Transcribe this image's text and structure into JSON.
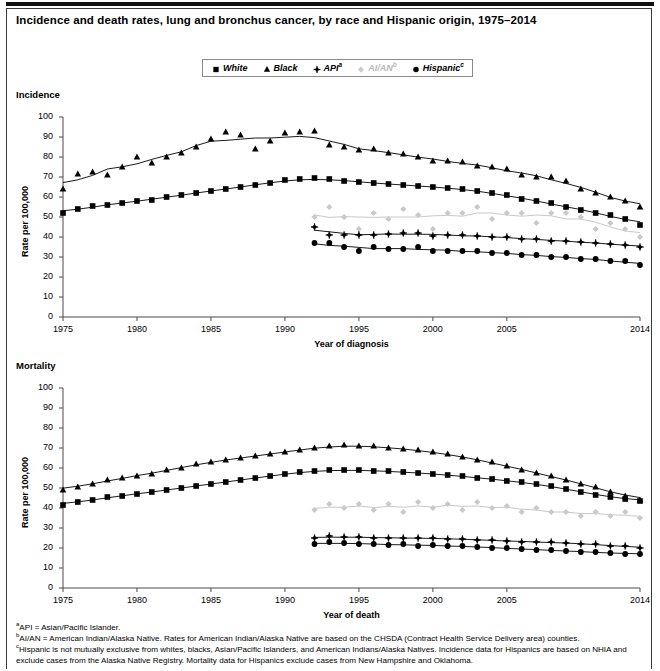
{
  "figure": {
    "title": "Incidence and death rates, lung and bronchus cancer, by race and Hispanic origin, 1975–2014",
    "panel_incidence_label": "Incidence",
    "panel_mortality_label": "Mortality"
  },
  "legend": {
    "position": "top-center",
    "items": [
      {
        "label": "White",
        "marker": "square",
        "color": "#000000"
      },
      {
        "label": "Black",
        "marker": "triangle",
        "color": "#000000"
      },
      {
        "label": "API",
        "sup": "a",
        "marker": "plus-diamond",
        "color": "#000000"
      },
      {
        "label": "AI/AN",
        "sup": "b",
        "marker": "diamond",
        "color": "#c9c9c9"
      },
      {
        "label": "Hispanic",
        "sup": "c",
        "marker": "circle",
        "color": "#000000"
      }
    ]
  },
  "axes": {
    "y_label": "Rate per 100,000",
    "y_ticks": [
      0,
      10,
      20,
      30,
      40,
      50,
      60,
      70,
      80,
      90,
      100
    ],
    "x_ticks": [
      1975,
      1980,
      1985,
      1990,
      1995,
      2000,
      2005,
      2014
    ],
    "x_label_incidence": "Year of diagnosis",
    "x_label_mortality": "Year of death",
    "xlim": [
      1975,
      2014
    ],
    "ylim": [
      0,
      100
    ]
  },
  "notes": [
    {
      "sup": "a",
      "text": "API = Asian/Pacific Islander."
    },
    {
      "sup": "b",
      "text": "AI/AN = American Indian/Alaska Native. Rates for American Indian/Alaska Native are based on the CHSDA (Contract Health Service Delivery area) counties."
    },
    {
      "sup": "c",
      "text": "Hispanic is not mutually exclusive from whites, blacks, Asian/Pacific Islanders, and American Indians/Alaska Natives. Incidence data for Hispanics are based on NHIA and exclude cases from the Alaska Native Registry. Mortality data for Hispanics exclude cases from New Hampshire and Oklahoma."
    }
  ],
  "chart_data": [
    {
      "type": "line",
      "title": "Incidence",
      "xlabel": "Year of diagnosis",
      "ylabel": "Rate per 100,000",
      "xlim": [
        1975,
        2014
      ],
      "ylim": [
        0,
        100
      ],
      "grid": false,
      "legend_position": "top-center",
      "x": [
        1975,
        1976,
        1977,
        1978,
        1979,
        1980,
        1981,
        1982,
        1983,
        1984,
        1985,
        1986,
        1987,
        1988,
        1989,
        1990,
        1991,
        1992,
        1993,
        1994,
        1995,
        1996,
        1997,
        1998,
        1999,
        2000,
        2001,
        2002,
        2003,
        2004,
        2005,
        2006,
        2007,
        2008,
        2009,
        2010,
        2011,
        2012,
        2013,
        2014
      ],
      "series": [
        {
          "name": "White",
          "marker": "square",
          "color": "#000000",
          "values": [
            52,
            54,
            55.5,
            56,
            57,
            58,
            58.5,
            60,
            61,
            62,
            63,
            64,
            65,
            66,
            67,
            68.5,
            69,
            69.5,
            69,
            68,
            67.5,
            67,
            66.5,
            66,
            65.5,
            65,
            64.5,
            64,
            63,
            62,
            61,
            59,
            58,
            57,
            55,
            53.5,
            52,
            51,
            49,
            46
          ]
        },
        {
          "name": "Black",
          "marker": "triangle",
          "color": "#000000",
          "values": [
            64,
            71.5,
            72.5,
            71,
            75,
            80,
            77,
            80,
            82,
            85,
            89,
            92.5,
            91,
            84,
            88,
            92,
            92.5,
            93,
            86,
            85,
            83.5,
            84,
            82,
            81.5,
            80,
            78,
            78,
            77.5,
            75.5,
            75,
            74,
            71,
            70,
            70,
            68,
            64,
            62,
            60,
            58,
            55
          ]
        },
        {
          "name": "API",
          "marker": "plus-diamond",
          "color": "#000000",
          "values": [
            null,
            null,
            null,
            null,
            null,
            null,
            null,
            null,
            null,
            null,
            null,
            null,
            null,
            null,
            null,
            null,
            null,
            45,
            41,
            41,
            41,
            41,
            41.5,
            42,
            42,
            40.5,
            41,
            41,
            40.5,
            40,
            40,
            39,
            39,
            38,
            38,
            37.5,
            37,
            36.5,
            36,
            35
          ]
        },
        {
          "name": "AI/AN",
          "marker": "diamond",
          "color": "#c9c9c9",
          "values": [
            null,
            null,
            null,
            null,
            null,
            null,
            null,
            null,
            null,
            null,
            null,
            null,
            null,
            null,
            null,
            null,
            null,
            50,
            55,
            50,
            44,
            52,
            49,
            54,
            51,
            44,
            52,
            52,
            55,
            49,
            52,
            52,
            47,
            52,
            52,
            50,
            44,
            47,
            44,
            40
          ]
        },
        {
          "name": "Hispanic",
          "marker": "circle",
          "color": "#000000",
          "values": [
            null,
            null,
            null,
            null,
            null,
            null,
            null,
            null,
            null,
            null,
            null,
            null,
            null,
            null,
            null,
            null,
            null,
            37,
            37,
            35,
            33,
            35,
            34,
            34,
            35,
            33,
            33,
            33,
            33,
            32,
            32,
            31,
            31,
            30,
            30,
            29,
            29,
            28,
            28,
            26
          ]
        }
      ]
    },
    {
      "type": "line",
      "title": "Mortality",
      "xlabel": "Year of death",
      "ylabel": "Rate per 100,000",
      "xlim": [
        1975,
        2014
      ],
      "ylim": [
        0,
        100
      ],
      "grid": false,
      "legend_position": "top-center",
      "x": [
        1975,
        1976,
        1977,
        1978,
        1979,
        1980,
        1981,
        1982,
        1983,
        1984,
        1985,
        1986,
        1987,
        1988,
        1989,
        1990,
        1991,
        1992,
        1993,
        1994,
        1995,
        1996,
        1997,
        1998,
        1999,
        2000,
        2001,
        2002,
        2003,
        2004,
        2005,
        2006,
        2007,
        2008,
        2009,
        2010,
        2011,
        2012,
        2013,
        2014
      ],
      "series": [
        {
          "name": "White",
          "marker": "square",
          "color": "#000000",
          "values": [
            41.5,
            43,
            44,
            45.5,
            46,
            47,
            48,
            49,
            50,
            51,
            52,
            53,
            54,
            55,
            56,
            57,
            58,
            58.5,
            59,
            59,
            59,
            58.5,
            58.5,
            58,
            57.5,
            57,
            56.5,
            56,
            55,
            54.5,
            53.5,
            53,
            52,
            51,
            49.5,
            48,
            46.5,
            45.5,
            44.5,
            43.5
          ]
        },
        {
          "name": "Black",
          "marker": "triangle",
          "color": "#000000",
          "values": [
            49,
            50.5,
            52,
            54,
            55,
            56,
            57,
            59,
            60,
            62,
            63,
            64,
            65,
            66,
            67,
            68,
            69,
            70,
            71,
            71.5,
            71,
            71,
            70,
            69.5,
            69,
            68,
            67,
            65.5,
            64,
            63,
            61,
            59,
            57.5,
            56,
            54,
            52,
            50.5,
            48,
            46,
            44
          ]
        },
        {
          "name": "API",
          "marker": "plus-diamond",
          "color": "#000000",
          "values": [
            null,
            null,
            null,
            null,
            null,
            null,
            null,
            null,
            null,
            null,
            null,
            null,
            null,
            null,
            null,
            null,
            null,
            25,
            26,
            25.5,
            25.5,
            25,
            25,
            25,
            25,
            25,
            24.5,
            24.5,
            24,
            24,
            23.5,
            23,
            23,
            23,
            22.5,
            22,
            22,
            21,
            21,
            20
          ]
        },
        {
          "name": "AI/AN",
          "marker": "diamond",
          "color": "#c9c9c9",
          "values": [
            null,
            null,
            null,
            null,
            null,
            null,
            null,
            null,
            null,
            null,
            null,
            null,
            null,
            null,
            null,
            null,
            null,
            39,
            42,
            40,
            42,
            39,
            42,
            38,
            43,
            40,
            42,
            39,
            43,
            40,
            41,
            38,
            40,
            38,
            38,
            36,
            38,
            36,
            38,
            35
          ]
        },
        {
          "name": "Hispanic",
          "marker": "circle",
          "color": "#000000",
          "values": [
            null,
            null,
            null,
            null,
            null,
            null,
            null,
            null,
            null,
            null,
            null,
            null,
            null,
            null,
            null,
            null,
            null,
            22,
            23,
            22.5,
            22,
            22,
            21.5,
            22,
            21,
            21.5,
            21,
            21,
            20.5,
            20,
            20,
            19.5,
            19,
            19,
            18.5,
            18,
            18,
            17.5,
            17,
            17
          ]
        }
      ]
    }
  ]
}
